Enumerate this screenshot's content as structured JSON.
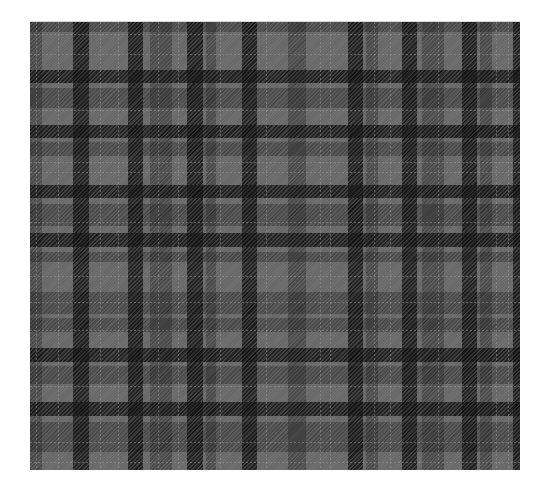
{
  "image": {
    "subject": "grayscale tartan plaid fabric pattern",
    "colors": {
      "background": "#ffffff",
      "base_gray": "#6b6b6b",
      "mid_band": "#555555",
      "dark_band": "#2a2a2a",
      "darkest_crossing": "#1e1e1e",
      "light_line": "#969696"
    },
    "fabric_bounds": {
      "left": 30,
      "top": 22,
      "width": 490,
      "height": 448
    },
    "dark_vertical_bands": [
      {
        "x": 43,
        "w": 16
      },
      {
        "x": 98,
        "w": 15
      },
      {
        "x": 157,
        "w": 16
      },
      {
        "x": 212,
        "w": 15
      },
      {
        "x": 318,
        "w": 15
      },
      {
        "x": 372,
        "w": 15
      },
      {
        "x": 432,
        "w": 15
      },
      {
        "x": 483,
        "w": 7
      }
    ],
    "dark_horizontal_bands": [
      {
        "y": 48,
        "h": 13
      },
      {
        "y": 103,
        "h": 13
      },
      {
        "y": 163,
        "h": 13
      },
      {
        "y": 211,
        "h": 14
      },
      {
        "y": 326,
        "h": 14
      },
      {
        "y": 380,
        "h": 14
      }
    ],
    "mid_vertical_bands": [
      {
        "x": 0,
        "w": 12
      },
      {
        "x": 120,
        "w": 22
      },
      {
        "x": 176,
        "w": 10
      },
      {
        "x": 258,
        "w": 18
      },
      {
        "x": 336,
        "w": 12
      },
      {
        "x": 392,
        "w": 22
      },
      {
        "x": 450,
        "w": 12
      }
    ],
    "mid_horizontal_bands": [
      {
        "y": 0,
        "h": 10
      },
      {
        "y": 66,
        "h": 20
      },
      {
        "y": 120,
        "h": 14
      },
      {
        "y": 182,
        "h": 22
      },
      {
        "y": 230,
        "h": 10
      },
      {
        "y": 270,
        "h": 22
      },
      {
        "y": 296,
        "h": 14
      },
      {
        "y": 344,
        "h": 18
      },
      {
        "y": 400,
        "h": 30
      }
    ],
    "light_vertical_lines": [
      6,
      28,
      70,
      88,
      128,
      148,
      190,
      236,
      290,
      300,
      344,
      360,
      408,
      466,
      478
    ],
    "light_horizontal_lines": [
      12,
      32,
      88,
      140,
      150,
      200,
      254,
      280,
      308,
      364,
      420,
      440
    ]
  }
}
